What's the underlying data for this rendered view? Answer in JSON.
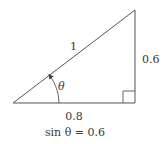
{
  "diagram": {
    "type": "right-triangle",
    "labels": {
      "hypotenuse": "1",
      "opposite": "0.6",
      "adjacent": "0.8",
      "angle": "θ",
      "equation": "sin θ = 0.6"
    },
    "vertices": {
      "left": [
        13,
        103
      ],
      "right_angle": [
        135,
        103
      ],
      "top": [
        135,
        10
      ]
    },
    "colors": {
      "line": "#555555",
      "text": "#3a3a3a",
      "background": "#ffffff"
    }
  }
}
